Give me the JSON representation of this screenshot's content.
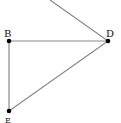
{
  "diagram": {
    "type": "geometry",
    "points": [
      {
        "id": "B",
        "label": "B",
        "x": 9,
        "y": 41,
        "lx": 4,
        "ly": 37
      },
      {
        "id": "D",
        "label": "D",
        "x": 108,
        "y": 41,
        "lx": 106,
        "ly": 37
      },
      {
        "id": "E",
        "label": "E",
        "x": 9,
        "y": 111,
        "lx": 5,
        "ly": 123
      }
    ],
    "segments": [
      {
        "from": "B",
        "to": "D"
      },
      {
        "from": "B",
        "to": "E"
      },
      {
        "from": "E",
        "to": "D"
      },
      {
        "from": "D",
        "to": "offscreen-top"
      }
    ],
    "colors": {
      "line": "#8a8a8a",
      "point": "#000000",
      "label": "#111111"
    }
  }
}
